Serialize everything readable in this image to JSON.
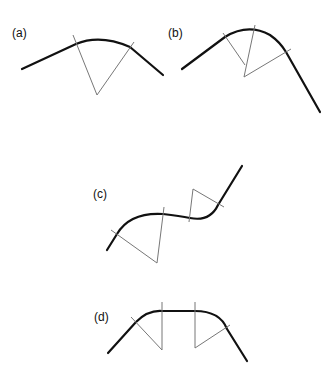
{
  "panels": [
    {
      "id": "a",
      "label": "(a)",
      "label_pos": [
        12,
        27
      ]
    },
    {
      "id": "b",
      "label": "(b)",
      "label_pos": [
        168,
        27
      ]
    },
    {
      "id": "c",
      "label": "(c)",
      "label_pos": [
        93,
        188
      ]
    },
    {
      "id": "d",
      "label": "(d)",
      "label_pos": [
        94,
        311
      ]
    }
  ],
  "colors": {
    "curve": "#111111",
    "construction_line": "#777777",
    "background": "#ffffff"
  }
}
